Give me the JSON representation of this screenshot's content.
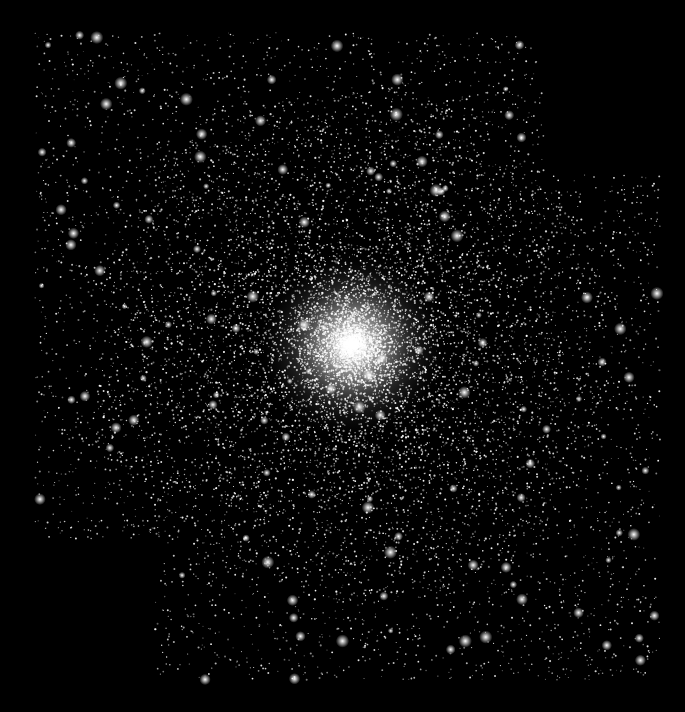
{
  "image": {
    "subject": "globular star cluster mosaic",
    "width": 685,
    "height": 712,
    "background_color": "#000000",
    "star_color": "#ffffff"
  },
  "mosaic_tiles": [
    {
      "name": "upper-left-tile",
      "x": 35,
      "y": 32,
      "w": 510,
      "h": 508
    },
    {
      "name": "lower-right-tile",
      "x": 155,
      "y": 175,
      "w": 505,
      "h": 505
    }
  ],
  "cluster_core": {
    "cx": 352,
    "cy": 345,
    "core_radius": 60,
    "halo_radius": 260
  },
  "render": {
    "seed": 7,
    "field_stars": 5200,
    "cluster_stars": 9000,
    "bright_stars": 140
  }
}
